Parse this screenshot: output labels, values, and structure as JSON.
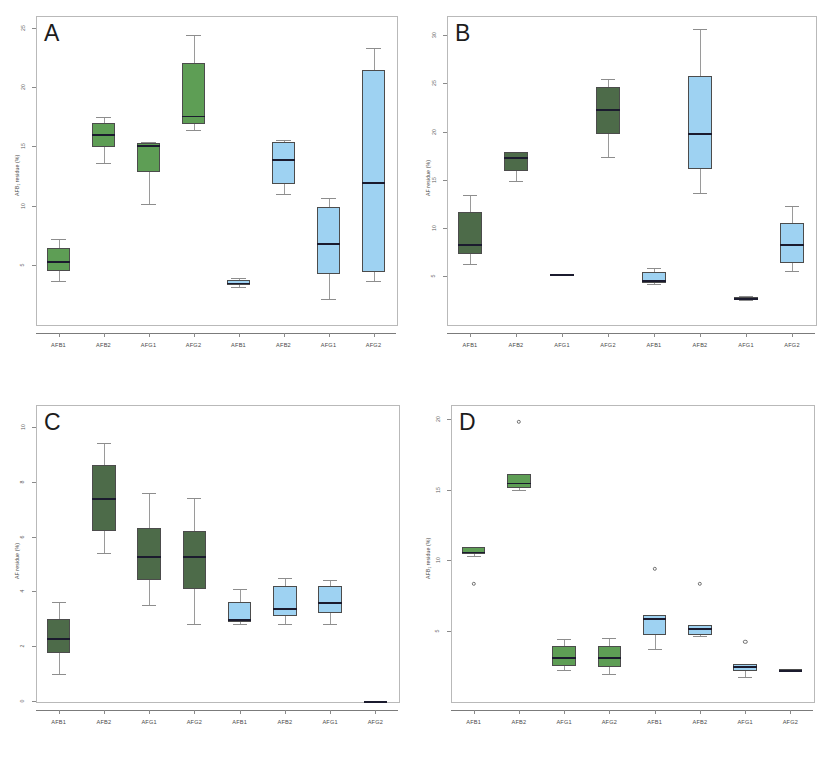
{
  "figure": {
    "background": "#ffffff",
    "width": 823,
    "height": 758,
    "caption": ""
  },
  "colors": {
    "green_bright": "#5e9e55",
    "green_dark": "#4d6b49",
    "blue_light": "#9ed2f2",
    "median": "#1b1b2e",
    "box_border": "#4c4c4c",
    "whisker": "#9a9a9a",
    "axis": "#8a8a8a",
    "frame": "#b9b9b9",
    "text": "#4a4a4a"
  },
  "chart_data": [
    {
      "id": "A",
      "type": "box",
      "title": "A",
      "xlabel": "",
      "ylabel": "AFB₁ residue (%)",
      "ylim": [
        0,
        26
      ],
      "yticks": [
        5,
        10,
        15,
        20,
        25
      ],
      "ytick_labels": [
        "5",
        "10",
        "15",
        "20",
        "25"
      ],
      "grid": false,
      "legend": "none",
      "categories": [
        "AFB1",
        "AFB2",
        "AFG1",
        "AFG2",
        "AFB1",
        "AFB2",
        "AFG1",
        "AFG2"
      ],
      "boxes": [
        {
          "label": "AFB1",
          "group": "green",
          "color": "#5e9e55",
          "whisker_low": 3.6,
          "q1": 4.5,
          "median": 5.3,
          "q3": 6.4,
          "whisker_high": 7.2,
          "outliers": []
        },
        {
          "label": "AFB2",
          "group": "green",
          "color": "#5e9e55",
          "whisker_low": 13.6,
          "q1": 14.9,
          "median": 16.0,
          "q3": 17.0,
          "whisker_high": 17.5,
          "outliers": []
        },
        {
          "label": "AFG1",
          "group": "green",
          "color": "#5e9e55",
          "whisker_low": 10.1,
          "q1": 12.8,
          "median": 15.1,
          "q3": 15.3,
          "whisker_high": 15.4,
          "outliers": []
        },
        {
          "label": "AFG2",
          "group": "green",
          "color": "#5e9e55",
          "whisker_low": 16.4,
          "q1": 16.9,
          "median": 17.6,
          "q3": 22.0,
          "whisker_high": 24.4,
          "outliers": []
        },
        {
          "label": "AFB1",
          "group": "blue",
          "color": "#9ed2f2",
          "whisker_low": 3.1,
          "q1": 3.3,
          "median": 3.5,
          "q3": 3.7,
          "whisker_high": 3.9,
          "outliers": []
        },
        {
          "label": "AFB2",
          "group": "blue",
          "color": "#9ed2f2",
          "whisker_low": 11.0,
          "q1": 11.8,
          "median": 13.9,
          "q3": 15.4,
          "whisker_high": 15.5,
          "outliers": []
        },
        {
          "label": "AFG1",
          "group": "blue",
          "color": "#9ed2f2",
          "whisker_low": 2.1,
          "q1": 4.2,
          "median": 6.8,
          "q3": 9.9,
          "whisker_high": 10.6,
          "outliers": []
        },
        {
          "label": "AFG2",
          "group": "blue",
          "color": "#9ed2f2",
          "whisker_low": 3.6,
          "q1": 4.4,
          "median": 12.0,
          "q3": 21.4,
          "whisker_high": 23.3,
          "outliers": []
        }
      ]
    },
    {
      "id": "B",
      "type": "box",
      "title": "B",
      "xlabel": "",
      "ylabel": "AF residue (%)",
      "ylim": [
        0,
        32
      ],
      "yticks": [
        5,
        10,
        15,
        20,
        25,
        30
      ],
      "ytick_labels": [
        "5",
        "10",
        "15",
        "20",
        "25",
        "30"
      ],
      "grid": false,
      "legend": "none",
      "categories": [
        "AFB1",
        "AFB2",
        "AFG1",
        "AFG2",
        "AFB1",
        "AFB2",
        "AFG1",
        "AFG2"
      ],
      "boxes": [
        {
          "label": "AFB1",
          "group": "green",
          "color": "#4d6b49",
          "whisker_low": 6.2,
          "q1": 7.3,
          "median": 8.3,
          "q3": 11.6,
          "whisker_high": 13.4,
          "outliers": []
        },
        {
          "label": "AFB2",
          "group": "green",
          "color": "#4d6b49",
          "whisker_low": 14.9,
          "q1": 15.9,
          "median": 17.3,
          "q3": 17.9,
          "whisker_high": 17.9,
          "outliers": []
        },
        {
          "label": "AFG1",
          "group": "green",
          "color": "#4d6b49",
          "whisker_low": 5.1,
          "q1": 5.1,
          "median": 5.15,
          "q3": 5.2,
          "whisker_high": 5.2,
          "outliers": []
        },
        {
          "label": "AFG2",
          "group": "green",
          "color": "#4d6b49",
          "whisker_low": 17.3,
          "q1": 19.7,
          "median": 22.3,
          "q3": 24.6,
          "whisker_high": 25.5,
          "outliers": []
        },
        {
          "label": "AFB1",
          "group": "blue",
          "color": "#9ed2f2",
          "whisker_low": 4.2,
          "q1": 4.3,
          "median": 4.6,
          "q3": 5.4,
          "whisker_high": 5.8,
          "outliers": []
        },
        {
          "label": "AFB2",
          "group": "blue",
          "color": "#9ed2f2",
          "whisker_low": 13.6,
          "q1": 16.1,
          "median": 19.8,
          "q3": 25.8,
          "whisker_high": 30.6,
          "outliers": []
        },
        {
          "label": "AFG1",
          "group": "blue",
          "color": "#9ed2f2",
          "whisker_low": 2.5,
          "q1": 2.6,
          "median": 2.7,
          "q3": 2.8,
          "whisker_high": 2.9,
          "outliers": []
        },
        {
          "label": "AFG2",
          "group": "blue",
          "color": "#9ed2f2",
          "whisker_low": 5.5,
          "q1": 6.3,
          "median": 8.3,
          "q3": 10.5,
          "whisker_high": 12.3,
          "outliers": []
        }
      ]
    },
    {
      "id": "C",
      "type": "box",
      "title": "C",
      "xlabel": "",
      "ylabel": "AF residue (%)",
      "ylim": [
        0,
        10.8
      ],
      "yticks": [
        0,
        2,
        4,
        6,
        8,
        10
      ],
      "ytick_labels": [
        "0",
        "2",
        "4",
        "6",
        "8",
        "10"
      ],
      "grid": false,
      "legend": "none",
      "categories": [
        "AFB1",
        "AFB2",
        "AFG1",
        "AFG2",
        "AFB1",
        "AFB2",
        "AFG1",
        "AFG2"
      ],
      "boxes": [
        {
          "label": "AFB1",
          "group": "green",
          "color": "#4d6b49",
          "whisker_low": 1.0,
          "q1": 1.75,
          "median": 2.3,
          "q3": 3.0,
          "whisker_high": 3.6,
          "outliers": []
        },
        {
          "label": "AFB2",
          "group": "green",
          "color": "#4d6b49",
          "whisker_low": 5.4,
          "q1": 6.2,
          "median": 7.4,
          "q3": 8.6,
          "whisker_high": 9.4,
          "outliers": []
        },
        {
          "label": "AFG1",
          "group": "green",
          "color": "#4d6b49",
          "whisker_low": 3.5,
          "q1": 4.4,
          "median": 5.3,
          "q3": 6.3,
          "whisker_high": 7.6,
          "outliers": []
        },
        {
          "label": "AFG2",
          "group": "green",
          "color": "#4d6b49",
          "whisker_low": 2.8,
          "q1": 4.1,
          "median": 5.3,
          "q3": 6.2,
          "whisker_high": 7.4,
          "outliers": []
        },
        {
          "label": "AFB1",
          "group": "blue",
          "color": "#9ed2f2",
          "whisker_low": 2.8,
          "q1": 2.9,
          "median": 3.0,
          "q3": 3.6,
          "whisker_high": 4.1,
          "outliers": []
        },
        {
          "label": "AFB2",
          "group": "blue",
          "color": "#9ed2f2",
          "whisker_low": 2.8,
          "q1": 3.1,
          "median": 3.4,
          "q3": 4.2,
          "whisker_high": 4.5,
          "outliers": []
        },
        {
          "label": "AFG1",
          "group": "blue",
          "color": "#9ed2f2",
          "whisker_low": 2.8,
          "q1": 3.2,
          "median": 3.6,
          "q3": 4.2,
          "whisker_high": 4.4,
          "outliers": []
        },
        {
          "label": "AFG2",
          "group": "blue",
          "color": "#1b1b2e",
          "whisker_low": 0.0,
          "q1": 0.0,
          "median": 0.0,
          "q3": 0.0,
          "whisker_high": 0.0,
          "outliers": []
        }
      ]
    },
    {
      "id": "D",
      "type": "box",
      "title": "D",
      "xlabel": "",
      "ylabel": "AFB₁ residue (%)",
      "ylim": [
        0,
        21
      ],
      "yticks": [
        5,
        10,
        15,
        20
      ],
      "ytick_labels": [
        "5",
        "10",
        "15",
        "20"
      ],
      "grid": false,
      "legend": "none",
      "categories": [
        "AFB1",
        "AFB2",
        "AFG1",
        "AFG2",
        "AFB1",
        "AFB2",
        "AFG1",
        "AFG2"
      ],
      "boxes": [
        {
          "label": "AFB1",
          "group": "green",
          "color": "#5e9e55",
          "whisker_low": 10.3,
          "q1": 10.4,
          "median": 10.6,
          "q3": 10.9,
          "whisker_high": 10.9,
          "outliers": [
            8.3
          ]
        },
        {
          "label": "AFB2",
          "group": "green",
          "color": "#5e9e55",
          "whisker_low": 15.0,
          "q1": 15.1,
          "median": 15.5,
          "q3": 16.1,
          "whisker_high": 16.1,
          "outliers": [
            19.8
          ]
        },
        {
          "label": "AFG1",
          "group": "green",
          "color": "#5e9e55",
          "whisker_low": 2.2,
          "q1": 2.5,
          "median": 3.1,
          "q3": 3.9,
          "whisker_high": 4.4,
          "outliers": []
        },
        {
          "label": "AFG2",
          "group": "green",
          "color": "#5e9e55",
          "whisker_low": 1.9,
          "q1": 2.4,
          "median": 3.1,
          "q3": 3.9,
          "whisker_high": 4.5,
          "outliers": []
        },
        {
          "label": "AFB1",
          "group": "blue",
          "color": "#9ed2f2",
          "whisker_low": 3.7,
          "q1": 4.7,
          "median": 5.9,
          "q3": 6.1,
          "whisker_high": 6.1,
          "outliers": [
            9.4
          ]
        },
        {
          "label": "AFB2",
          "group": "blue",
          "color": "#9ed2f2",
          "whisker_low": 4.6,
          "q1": 4.7,
          "median": 5.2,
          "q3": 5.4,
          "whisker_high": 5.4,
          "outliers": [
            8.3
          ]
        },
        {
          "label": "AFG1",
          "group": "blue",
          "color": "#9ed2f2",
          "whisker_low": 1.7,
          "q1": 2.1,
          "median": 2.5,
          "q3": 2.6,
          "whisker_high": 2.6,
          "outliers": [
            4.2
          ]
        },
        {
          "label": "AFG2",
          "group": "blue",
          "color": "#9ed2f2",
          "whisker_low": 2.1,
          "q1": 2.15,
          "median": 2.2,
          "q3": 2.3,
          "whisker_high": 2.3,
          "outliers": []
        }
      ]
    }
  ]
}
